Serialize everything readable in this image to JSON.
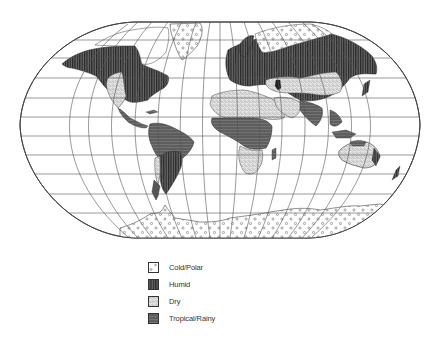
{
  "map": {
    "type": "world-climate-zones",
    "projection": "winkel-tripel-like",
    "graticule": true,
    "colors": {
      "outline": "#444444",
      "grid": "#555555",
      "humid": "#3a3a3a",
      "tropical": "#5a5a5a",
      "dry": "#cfcfcf",
      "cold": "#ffffff"
    }
  },
  "legend": {
    "items": [
      {
        "key": "cold",
        "label": "Cold/Polar",
        "icon": "dotted-swatch"
      },
      {
        "key": "humid",
        "label": "Humid",
        "icon": "striped-swatch"
      },
      {
        "key": "dry",
        "label": "Dry",
        "icon": "stippled-swatch"
      },
      {
        "key": "tropical",
        "label": "Tropical/Rainy",
        "icon": "dark-swatch"
      }
    ]
  }
}
